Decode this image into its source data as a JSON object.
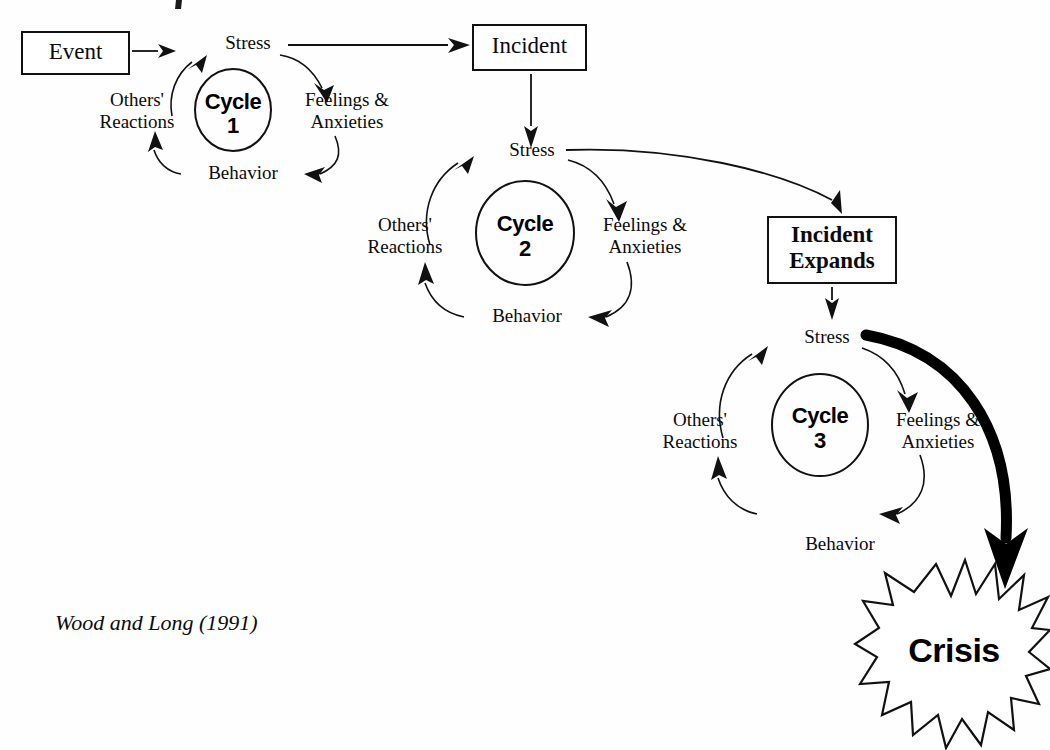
{
  "figure": {
    "citation": "Wood and Long (1991)",
    "stroke_color": "#111111",
    "background_color": "#ffffff",
    "accent_color": "#000000"
  },
  "boxes": {
    "event": {
      "label": "Event"
    },
    "incident": {
      "label": "Incident"
    },
    "incident_expands": {
      "label_line1": "Incident",
      "label_line2": "Expands"
    }
  },
  "cycles": [
    {
      "id": "cycle-1",
      "center_label": "Cycle",
      "center_number": "1",
      "nodes": {
        "stress": "Stress",
        "feelings": {
          "line1": "Feelings &",
          "line2": "Anxieties"
        },
        "behavior": "Behavior",
        "others": {
          "line1": "Others'",
          "line2": "Reactions"
        }
      }
    },
    {
      "id": "cycle-2",
      "center_label": "Cycle",
      "center_number": "2",
      "nodes": {
        "stress": "Stress",
        "feelings": {
          "line1": "Feelings &",
          "line2": "Anxieties"
        },
        "behavior": "Behavior",
        "others": {
          "line1": "Others'",
          "line2": "Reactions"
        }
      }
    },
    {
      "id": "cycle-3",
      "center_label": "Cycle",
      "center_number": "3",
      "nodes": {
        "stress": "Stress",
        "feelings": {
          "line1": "Feelings &",
          "line2": "Anxieties"
        },
        "behavior": "Behavior",
        "others": {
          "line1": "Others'",
          "line2": "Reactions"
        }
      }
    }
  ],
  "outcome": {
    "crisis_label": "Crisis",
    "shape": "starburst",
    "points": 16
  },
  "connections": [
    {
      "name": "event-to-stress-1",
      "from": "Event",
      "to": "Stress (Cycle 1)",
      "style": "thin-arrow"
    },
    {
      "name": "stress1-to-incident",
      "from": "Stress (Cycle 1)",
      "to": "Incident",
      "style": "thin-arrow"
    },
    {
      "name": "incident-to-stress-2",
      "from": "Incident",
      "to": "Stress (Cycle 2)",
      "style": "thin-arrow"
    },
    {
      "name": "stress2-to-incident-expands",
      "from": "Stress (Cycle 2)",
      "to": "Incident Expands",
      "style": "curved-arrow"
    },
    {
      "name": "incident-expands-to-stress-3",
      "from": "Incident Expands",
      "to": "Stress (Cycle 3)",
      "style": "thin-arrow"
    },
    {
      "name": "stress3-to-crisis",
      "from": "Stress (Cycle 3)",
      "to": "Crisis",
      "style": "thick-curved-arrow"
    }
  ]
}
